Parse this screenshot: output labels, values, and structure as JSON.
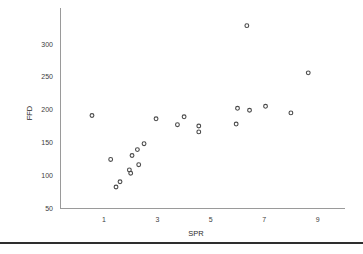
{
  "chart_data": {
    "type": "scatter",
    "title": "",
    "xlabel": "SPR",
    "ylabel": "FFD",
    "xlim": [
      0,
      9.6
    ],
    "ylim": [
      50,
      340
    ],
    "xticks": [
      1,
      3,
      5,
      7,
      9
    ],
    "yticks": [
      50,
      100,
      150,
      200,
      250,
      300
    ],
    "grid": false,
    "legend": null,
    "marker_style": "open-circle",
    "marker_color": "#4a4a4a",
    "points": [
      {
        "x": 0.55,
        "y": 191
      },
      {
        "x": 1.25,
        "y": 124
      },
      {
        "x": 1.45,
        "y": 82
      },
      {
        "x": 1.6,
        "y": 90
      },
      {
        "x": 1.95,
        "y": 108
      },
      {
        "x": 2.0,
        "y": 103
      },
      {
        "x": 2.05,
        "y": 130
      },
      {
        "x": 2.25,
        "y": 139
      },
      {
        "x": 2.3,
        "y": 116
      },
      {
        "x": 2.5,
        "y": 148
      },
      {
        "x": 2.95,
        "y": 186
      },
      {
        "x": 3.75,
        "y": 177
      },
      {
        "x": 4.0,
        "y": 189
      },
      {
        "x": 4.55,
        "y": 175
      },
      {
        "x": 4.55,
        "y": 166
      },
      {
        "x": 5.95,
        "y": 178
      },
      {
        "x": 6.0,
        "y": 202
      },
      {
        "x": 6.35,
        "y": 328
      },
      {
        "x": 6.45,
        "y": 199
      },
      {
        "x": 7.05,
        "y": 205
      },
      {
        "x": 8.0,
        "y": 195
      },
      {
        "x": 8.65,
        "y": 256
      }
    ]
  },
  "axes": {
    "y_tick_labels": [
      "300",
      "250",
      "200",
      "150",
      "100",
      "50"
    ],
    "x_tick_labels": [
      "1",
      "3",
      "5",
      "7",
      "9"
    ],
    "y_axis_title": "FFD",
    "x_axis_title": "SPR"
  }
}
